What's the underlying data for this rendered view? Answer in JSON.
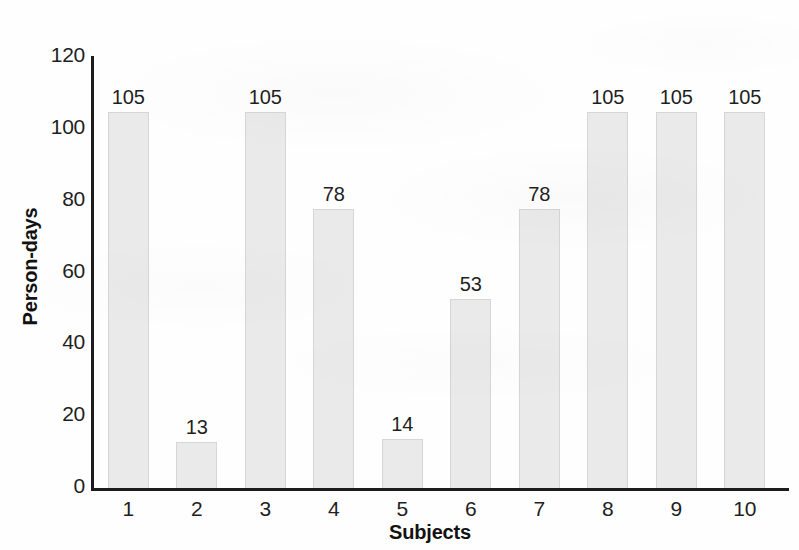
{
  "chart_data": {
    "type": "bar",
    "title": "",
    "subtitle": "",
    "xlabel": "Subjects",
    "ylabel": "Person-days",
    "categories": [
      "1",
      "2",
      "3",
      "4",
      "5",
      "6",
      "7",
      "8",
      "9",
      "10"
    ],
    "values": [
      105,
      13,
      105,
      78,
      14,
      53,
      78,
      105,
      105,
      105
    ],
    "data_labels": [
      "105",
      "13",
      "105",
      "78",
      "14",
      "53",
      "78",
      "105",
      "105",
      "105"
    ],
    "ylim": [
      0,
      120
    ],
    "ytick_labels": [
      "0",
      "20",
      "40",
      "60",
      "80",
      "100",
      "120"
    ],
    "ytick_values": [
      0,
      20,
      40,
      60,
      80,
      100,
      120
    ],
    "grid": false,
    "legend": false,
    "legend_position": "none",
    "bar_fill_color": "#eaeaea",
    "bar_border_color": "#d6d6d6",
    "axis_color": "#1c1c1c",
    "text_color": "#1f1f1f",
    "background_color": "#ffffff"
  }
}
